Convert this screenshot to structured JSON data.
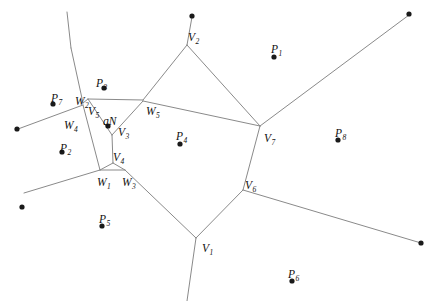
{
  "figure": {
    "kind": "voronoi-diagram",
    "width": 433,
    "height": 301,
    "background_color": "#ffffff",
    "edge_color": "#8a8a8a",
    "point_color": "#1a1a1a",
    "clipped_header_text": ""
  },
  "labels": [
    {
      "id": "P1",
      "base": "P",
      "sub": "1",
      "x": 271,
      "y": 44
    },
    {
      "id": "P2",
      "base": "P",
      "sub": "2",
      "x": 60,
      "y": 143
    },
    {
      "id": "P3",
      "base": "P",
      "sub": "3",
      "x": 96,
      "y": 78
    },
    {
      "id": "P4",
      "base": "P",
      "sub": "4",
      "x": 176,
      "y": 131
    },
    {
      "id": "P5",
      "base": "P",
      "sub": "5",
      "x": 99,
      "y": 214
    },
    {
      "id": "P6",
      "base": "P",
      "sub": "6",
      "x": 288,
      "y": 269
    },
    {
      "id": "P7",
      "base": "P",
      "sub": "7",
      "x": 51,
      "y": 93
    },
    {
      "id": "P8",
      "base": "P",
      "sub": "8",
      "x": 335,
      "y": 128
    },
    {
      "id": "V1",
      "base": "V",
      "sub": "1",
      "x": 202,
      "y": 243
    },
    {
      "id": "V2",
      "base": "V",
      "sub": "2",
      "x": 188,
      "y": 32
    },
    {
      "id": "V3",
      "base": "V",
      "sub": "3",
      "x": 118,
      "y": 127
    },
    {
      "id": "V4",
      "base": "V",
      "sub": "4",
      "x": 113,
      "y": 152
    },
    {
      "id": "V5",
      "base": "V",
      "sub": "5",
      "x": 88,
      "y": 106
    },
    {
      "id": "V6",
      "base": "V",
      "sub": "6",
      "x": 245,
      "y": 180
    },
    {
      "id": "V7",
      "base": "V",
      "sub": "7",
      "x": 264,
      "y": 133
    },
    {
      "id": "W1",
      "base": "W",
      "sub": "1",
      "x": 97,
      "y": 177
    },
    {
      "id": "W2",
      "base": "W",
      "sub": "2",
      "x": 75,
      "y": 96
    },
    {
      "id": "W3",
      "base": "W",
      "sub": "3",
      "x": 122,
      "y": 177
    },
    {
      "id": "W4",
      "base": "W",
      "sub": "4",
      "x": 64,
      "y": 120
    },
    {
      "id": "W5",
      "base": "W",
      "sub": "5",
      "x": 146,
      "y": 106
    },
    {
      "id": "qN",
      "base": "qN",
      "sub": "",
      "x": 103,
      "y": 116
    }
  ],
  "site_points": [
    {
      "id": "point-top-v2",
      "x": 192,
      "y": 16,
      "r": 2.6
    },
    {
      "id": "point-top-right",
      "x": 409,
      "y": 14,
      "r": 2.6
    },
    {
      "id": "point-p1",
      "x": 274,
      "y": 57,
      "r": 2.6
    },
    {
      "id": "point-p3",
      "x": 104,
      "y": 88,
      "r": 2.6
    },
    {
      "id": "point-p7",
      "x": 53,
      "y": 104,
      "r": 2.6
    },
    {
      "id": "point-left-edge",
      "x": 17,
      "y": 129,
      "r": 2.6
    },
    {
      "id": "point-p8",
      "x": 338,
      "y": 140,
      "r": 2.6
    },
    {
      "id": "point-qn",
      "x": 108,
      "y": 126,
      "r": 2.6
    },
    {
      "id": "point-p2",
      "x": 62,
      "y": 152,
      "r": 2.6
    },
    {
      "id": "point-p4",
      "x": 180,
      "y": 144,
      "r": 2.6
    },
    {
      "id": "point-lower-left",
      "x": 22,
      "y": 207,
      "r": 2.6
    },
    {
      "id": "point-p5",
      "x": 102,
      "y": 226,
      "r": 2.6
    },
    {
      "id": "point-lower-right",
      "x": 421,
      "y": 243,
      "r": 2.6
    },
    {
      "id": "point-p6",
      "x": 292,
      "y": 281,
      "r": 2.6
    }
  ],
  "vertices": {
    "V1": {
      "x": 196,
      "y": 238
    },
    "V2": {
      "x": 187,
      "y": 45
    },
    "V3": {
      "x": 112,
      "y": 135
    },
    "V4": {
      "x": 113,
      "y": 163
    },
    "V5": {
      "x": 88,
      "y": 99
    },
    "V6": {
      "x": 243,
      "y": 190
    },
    "V7": {
      "x": 260,
      "y": 126
    },
    "W1": {
      "x": 100,
      "y": 170
    },
    "W2": {
      "x": 84,
      "y": 102
    },
    "W3": {
      "x": 125,
      "y": 170
    },
    "W4": {
      "x": 82,
      "y": 105
    },
    "W5": {
      "x": 143,
      "y": 100
    }
  },
  "edges": [
    {
      "id": "edge-v2-top",
      "x1": 187,
      "y1": 45,
      "x2": 192,
      "y2": 17
    },
    {
      "id": "edge-v2-w5",
      "x1": 187,
      "y1": 45,
      "x2": 143,
      "y2": 100
    },
    {
      "id": "edge-w5-v5",
      "x1": 143,
      "y1": 100,
      "x2": 88,
      "y2": 99
    },
    {
      "id": "edge-v5-w2",
      "x1": 88,
      "y1": 99,
      "x2": 83,
      "y2": 103
    },
    {
      "id": "edge-w2-up",
      "x1": 83,
      "y1": 103,
      "x2": 71,
      "y2": 48
    },
    {
      "id": "edge-up-top",
      "x1": 71,
      "y1": 48,
      "x2": 67,
      "y2": 12
    },
    {
      "id": "edge-w4-left",
      "x1": 83,
      "y1": 105,
      "x2": 18,
      "y2": 129
    },
    {
      "id": "edge-w4-down",
      "x1": 83,
      "y1": 105,
      "x2": 100,
      "y2": 170
    },
    {
      "id": "edge-v5-v3",
      "x1": 88,
      "y1": 99,
      "x2": 112,
      "y2": 135
    },
    {
      "id": "edge-v3-v4",
      "x1": 112,
      "y1": 135,
      "x2": 113,
      "y2": 163
    },
    {
      "id": "edge-v3-w5b",
      "x1": 112,
      "y1": 135,
      "x2": 143,
      "y2": 101
    },
    {
      "id": "edge-v4-w1",
      "x1": 113,
      "y1": 163,
      "x2": 100,
      "y2": 170
    },
    {
      "id": "edge-v4-w3",
      "x1": 113,
      "y1": 163,
      "x2": 125,
      "y2": 170
    },
    {
      "id": "edge-w1-w3",
      "x1": 100,
      "y1": 170,
      "x2": 125,
      "y2": 170
    },
    {
      "id": "edge-w1-left",
      "x1": 100,
      "y1": 170,
      "x2": 24,
      "y2": 193
    },
    {
      "id": "edge-w3-v1",
      "x1": 125,
      "y1": 170,
      "x2": 196,
      "y2": 238
    },
    {
      "id": "edge-w5-v7",
      "x1": 143,
      "y1": 101,
      "x2": 260,
      "y2": 126
    },
    {
      "id": "edge-v2-v7",
      "x1": 187,
      "y1": 45,
      "x2": 260,
      "y2": 126
    },
    {
      "id": "edge-v7-ne",
      "x1": 260,
      "y1": 126,
      "x2": 409,
      "y2": 15
    },
    {
      "id": "edge-v7-v6",
      "x1": 260,
      "y1": 126,
      "x2": 243,
      "y2": 190
    },
    {
      "id": "edge-v6-se",
      "x1": 243,
      "y1": 190,
      "x2": 421,
      "y2": 243
    },
    {
      "id": "edge-v6-v1",
      "x1": 243,
      "y1": 190,
      "x2": 196,
      "y2": 238
    },
    {
      "id": "edge-v1-down",
      "x1": 196,
      "y1": 238,
      "x2": 187,
      "y2": 301
    }
  ]
}
